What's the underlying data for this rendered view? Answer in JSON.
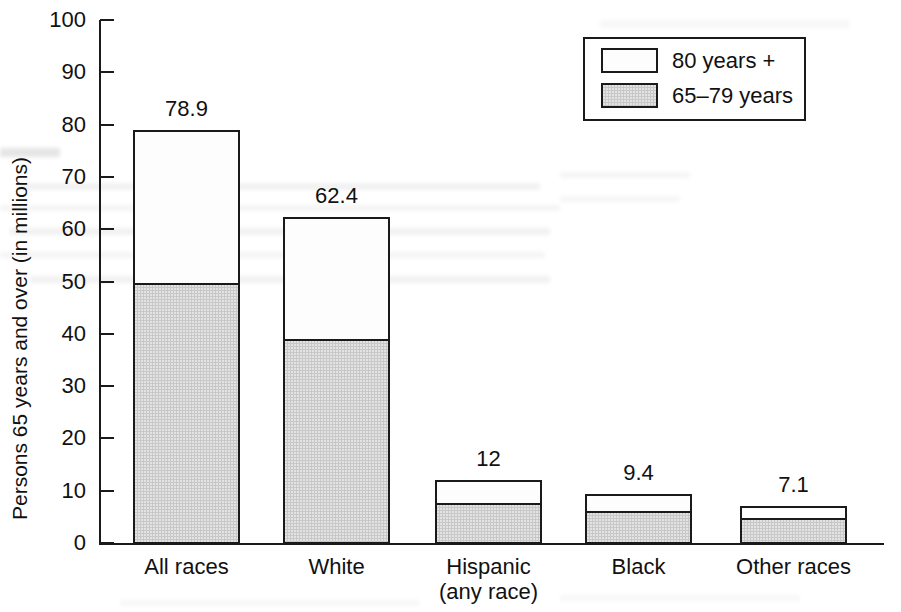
{
  "chart_data": {
    "type": "bar",
    "title": "",
    "subtitle": "",
    "xlabel": "",
    "ylabel": "Persons 65 years and over (in millions)",
    "ylim": [
      0,
      100
    ],
    "ytick_labels": [
      "100",
      "90",
      "80",
      "70",
      "60",
      "50",
      "40",
      "30",
      "20",
      "10",
      "0"
    ],
    "ytick_values": [
      100,
      90,
      80,
      70,
      60,
      50,
      40,
      30,
      20,
      10,
      0
    ],
    "grid": false,
    "stacked": true,
    "legend_position": "top-right",
    "categories": [
      "All races",
      "White",
      "Hispanic\n(any race)",
      "Black",
      "Other races"
    ],
    "category_labels_flat": [
      "All races",
      "White",
      "Hispanic (any race)",
      "Black",
      "Other races"
    ],
    "series": [
      {
        "name": "65–79 years",
        "color": "#c8c8c8",
        "values": [
          49.8,
          39.0,
          7.6,
          6.1,
          4.7
        ]
      },
      {
        "name": "80 years +",
        "color": "#ffffff",
        "values": [
          29.1,
          23.4,
          4.4,
          3.3,
          2.4
        ]
      }
    ],
    "totals": [
      78.9,
      62.4,
      12.0,
      9.4,
      7.1
    ],
    "total_labels": [
      "78.9",
      "62.4",
      "12",
      "9.4",
      "7.1"
    ]
  },
  "legend": {
    "items": [
      {
        "label": "80 years +",
        "swatch": "white"
      },
      {
        "label": "65–79 years",
        "swatch": "gray"
      }
    ]
  },
  "colors": {
    "axis": "#1a1a1a",
    "text": "#111111",
    "segment_upper": "#fdfdfd",
    "segment_lower": "#c8c8c8",
    "background": "#ffffff"
  }
}
